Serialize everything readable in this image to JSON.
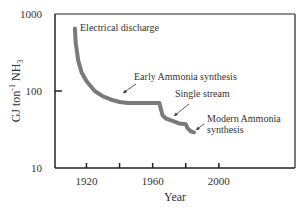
{
  "chart_data": {
    "type": "line",
    "title": "",
    "xlabel": "Year",
    "ylabel": "GJ ton⁻¹ NH₃",
    "ylabel_parts": {
      "main": "GJ ton",
      "sup": "-1",
      "mid": " NH",
      "sub": "3"
    },
    "yscale": "log",
    "xlim": [
      1901,
      2046
    ],
    "ylim": [
      10,
      1000
    ],
    "x_ticks": [
      1920,
      1940,
      1960,
      1980,
      2000
    ],
    "x_tick_labels": [
      "1920",
      "",
      "1960",
      "",
      "2000"
    ],
    "y_ticks": [
      10,
      100,
      1000
    ],
    "y_tick_labels": [
      "10",
      "100",
      "1000"
    ],
    "grid": false,
    "legend": null,
    "series": [
      {
        "name": "Energy consumption",
        "color": "#7a7a7a",
        "x": [
          1913,
          1913.5,
          1915,
          1917,
          1920,
          1925,
          1930,
          1935,
          1940,
          1945,
          1950,
          1955,
          1960,
          1964,
          1966,
          1968,
          1972,
          1976,
          1980,
          1981,
          1983,
          1985
        ],
        "y": [
          650,
          420,
          250,
          175,
          135,
          100,
          85,
          77,
          72,
          70,
          70,
          70,
          70,
          70,
          48,
          44,
          41,
          38,
          37,
          33,
          30,
          29
        ]
      }
    ],
    "annotations": [
      {
        "text": "Electrical discharge",
        "x": 1913,
        "y": 650,
        "arrow": false
      },
      {
        "text": "Early Ammonia synthesis",
        "x": 1940,
        "y": 72,
        "arrow": true
      },
      {
        "text": "Single stream",
        "x": 1968,
        "y": 44,
        "arrow": true
      },
      {
        "text": "Modern Ammonia",
        "text2": "synthesis",
        "x": 1983,
        "y": 31,
        "arrow": true
      }
    ]
  }
}
